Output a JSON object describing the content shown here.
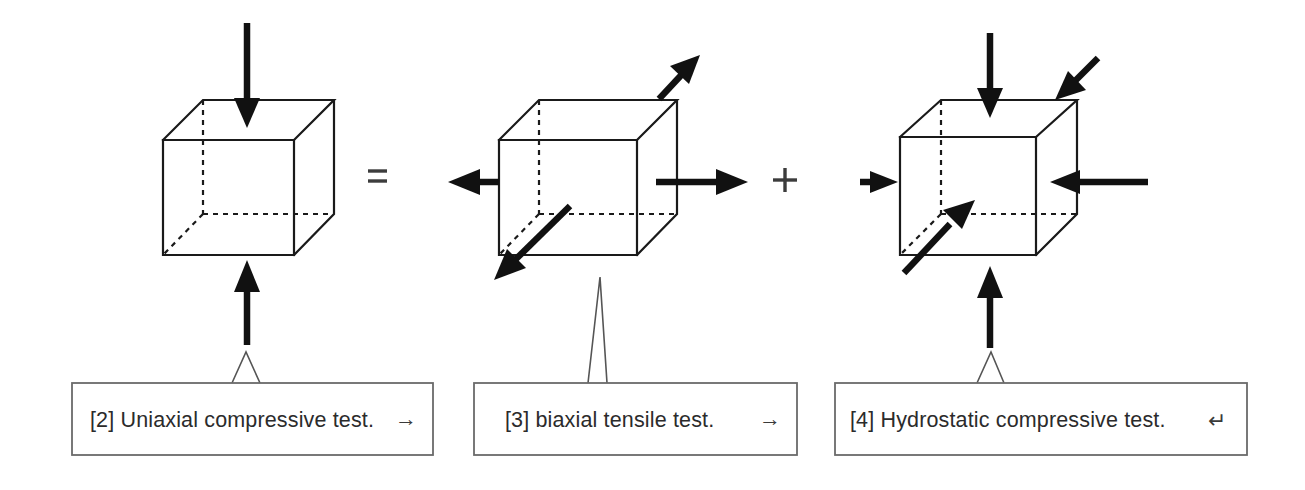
{
  "figure": {
    "width": 1305,
    "height": 490,
    "background": "#ffffff",
    "line_color": "#1a1a1a",
    "arrow_color": "#111111",
    "box_stroke": "#6a6a6a",
    "text_color": "#2b2b2b",
    "equation": "[2] Uniaxial compressive test. = [3] biaxial tensile test. + [4] Hydrostatic compressive test."
  },
  "operators": [
    {
      "name": "equals",
      "symbol": "=",
      "x": 377,
      "y": 176
    },
    {
      "name": "plus",
      "symbol": "+",
      "x": 785,
      "y": 180
    }
  ],
  "cubes": [
    {
      "id": "cube-uniaxial",
      "title": "Uniaxial compressive test",
      "loading": "uniaxial compression",
      "arrows": [
        {
          "name": "top-down-compression-arrow",
          "direction": "down",
          "face": "top"
        },
        {
          "name": "bottom-up-compression-arrow",
          "direction": "up",
          "face": "bottom"
        }
      ]
    },
    {
      "id": "cube-biaxial",
      "title": "biaxial tensile test",
      "loading": "biaxial tension",
      "arrows": [
        {
          "name": "left-outward-tension-arrow",
          "direction": "left",
          "face": "left"
        },
        {
          "name": "right-outward-tension-arrow",
          "direction": "right",
          "face": "right"
        },
        {
          "name": "back-upper-right-outward-tension-arrow",
          "direction": "up-right",
          "face": "back"
        },
        {
          "name": "front-lower-left-outward-tension-arrow",
          "direction": "down-left",
          "face": "front"
        }
      ]
    },
    {
      "id": "cube-hydrostatic",
      "title": "Hydrostatic compressive test",
      "loading": "hydrostatic compression",
      "arrows": [
        {
          "name": "top-down-compression-arrow",
          "direction": "down",
          "face": "top"
        },
        {
          "name": "bottom-up-compression-arrow",
          "direction": "up",
          "face": "bottom"
        },
        {
          "name": "left-inward-compression-arrow",
          "direction": "right",
          "face": "left"
        },
        {
          "name": "right-inward-compression-arrow",
          "direction": "left",
          "face": "right"
        },
        {
          "name": "back-upper-right-inward-compression-arrow",
          "direction": "down-left",
          "face": "back"
        },
        {
          "name": "front-lower-left-inward-compression-arrow",
          "direction": "up-right",
          "face": "front"
        }
      ]
    }
  ],
  "callouts": [
    {
      "id": "callout-2",
      "label": "[2] Uniaxial compressive test.",
      "mark": "→",
      "mark_name": "right-arrow-glyph"
    },
    {
      "id": "callout-3",
      "label": "[3] biaxial tensile test.",
      "mark": "→",
      "mark_name": "right-arrow-glyph"
    },
    {
      "id": "callout-4",
      "label": "[4] Hydrostatic compressive test.",
      "mark": "↵",
      "mark_name": "return-arrow-glyph"
    }
  ]
}
